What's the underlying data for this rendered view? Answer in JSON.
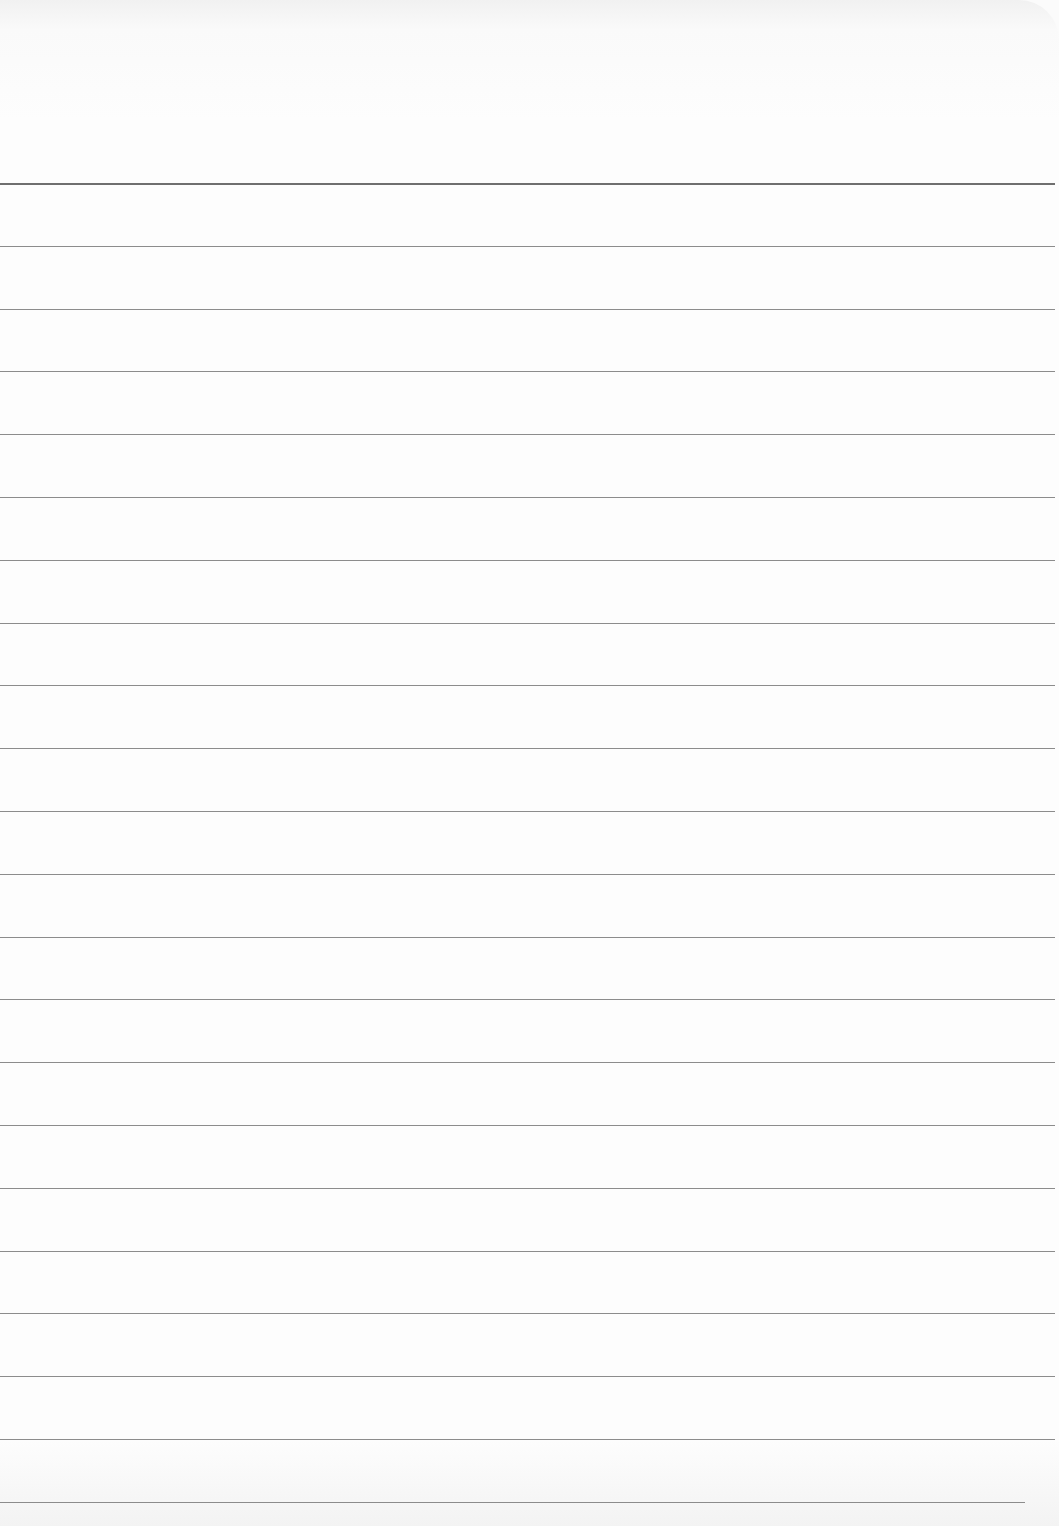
{
  "page": {
    "type": "lined paper",
    "header_line_y": 183,
    "first_line_y": 183,
    "line_spacing": 62.8,
    "line_count": 22,
    "line_color": "#8c8c8c",
    "header_line_color": "#6f6f6f",
    "paper_color": "#fdfdfd"
  }
}
